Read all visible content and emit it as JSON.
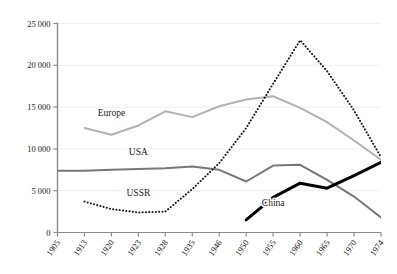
{
  "chart_data": {
    "type": "line",
    "title": "",
    "subtitle": "",
    "xlabel": "",
    "ylabel": "",
    "categories": [
      "1905",
      "1913",
      "1920",
      "1923",
      "1928",
      "1935",
      "1946",
      "1950",
      "1955",
      "1960",
      "1965",
      "1970",
      "1974"
    ],
    "ylim": [
      0,
      25000
    ],
    "ytick_labels": [
      "0",
      "5 000",
      "10 000",
      "15 000",
      "20 000",
      "25 000"
    ],
    "ytick_values": [
      0,
      5000,
      10000,
      15000,
      20000,
      25000
    ],
    "grid": true,
    "grid_axis": "y",
    "legend": "inline-labels",
    "series": [
      {
        "name": "Europe",
        "label": "Europe",
        "color": "#b3b3b3",
        "style": "solid",
        "width": 2.0,
        "label_x": "1920",
        "label_y": 13900,
        "values": [
          null,
          12500,
          11700,
          12800,
          14500,
          13800,
          15100,
          15900,
          16300,
          14900,
          13200,
          11000,
          8700
        ]
      },
      {
        "name": "USA",
        "label": "USA",
        "color": "#777777",
        "style": "solid",
        "width": 2.0,
        "label_x": "1923",
        "label_y": 9300,
        "values": [
          7400,
          7400,
          7500,
          7600,
          7700,
          7900,
          7500,
          6100,
          8000,
          8100,
          6300,
          4300,
          1800
        ]
      },
      {
        "name": "USSR",
        "label": "USSR",
        "color": "#1a1a1a",
        "style": "dotted",
        "width": 2.0,
        "label_x": "1923",
        "label_y": 4400,
        "values": [
          null,
          3700,
          2800,
          2400,
          2500,
          5200,
          8300,
          12500,
          17800,
          23000,
          19300,
          14600,
          9000
        ]
      },
      {
        "name": "China",
        "label": "China",
        "color": "#000000",
        "style": "solid",
        "width": 3.0,
        "label_x": "1955",
        "label_y": 3200,
        "values": [
          null,
          null,
          null,
          null,
          null,
          null,
          null,
          1500,
          4200,
          5900,
          5300,
          6800,
          8400
        ]
      }
    ]
  }
}
